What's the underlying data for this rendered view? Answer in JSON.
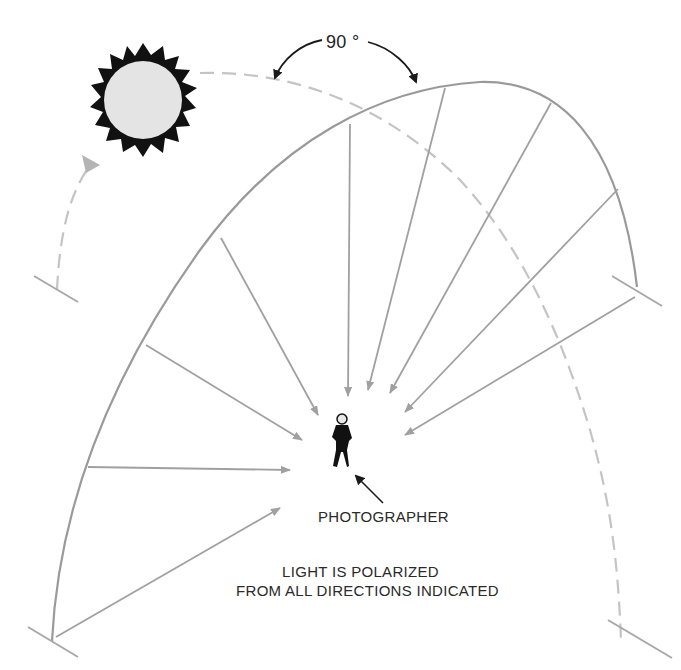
{
  "diagram": {
    "angle_label": "90 °",
    "photographer_label": "PHOTOGRAPHER",
    "caption": {
      "line1": "LIGHT IS POLARIZED",
      "line2": "FROM ALL DIRECTIONS INDICATED"
    },
    "icons": {
      "sun": "sun-icon",
      "person": "photographer-figure-icon"
    },
    "colors": {
      "arc": "#9a9a9a",
      "dashed_arc": "#c4c4c4",
      "arrows": "#a0a0a0",
      "sun_fill": "#e4e4e4",
      "sun_rays": "#111111",
      "text": "#2a2a2a"
    }
  }
}
